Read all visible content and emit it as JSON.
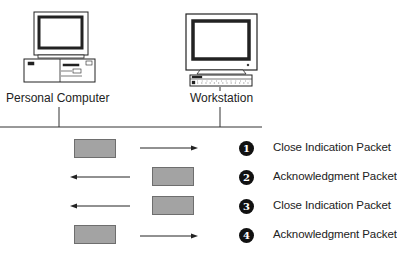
{
  "diagram": {
    "devices": [
      {
        "id": "pc",
        "label": "Personal Computer",
        "icon": "desktop-pc-icon"
      },
      {
        "id": "ws",
        "label": "Workstation",
        "icon": "workstation-icon"
      }
    ],
    "steps": [
      {
        "number": "1",
        "label": "Close Indication Packet",
        "direction": "right"
      },
      {
        "number": "2",
        "label": "Acknowledgment Packet",
        "direction": "left"
      },
      {
        "number": "3",
        "label": "Close Indication Packet",
        "direction": "left"
      },
      {
        "number": "4",
        "label": "Acknowledgment Packet",
        "direction": "right"
      }
    ],
    "colors": {
      "packet_fill": "#a3a3a3",
      "packet_border": "#6e6e6e",
      "step_circle": "#111111",
      "line": "#333333"
    }
  }
}
